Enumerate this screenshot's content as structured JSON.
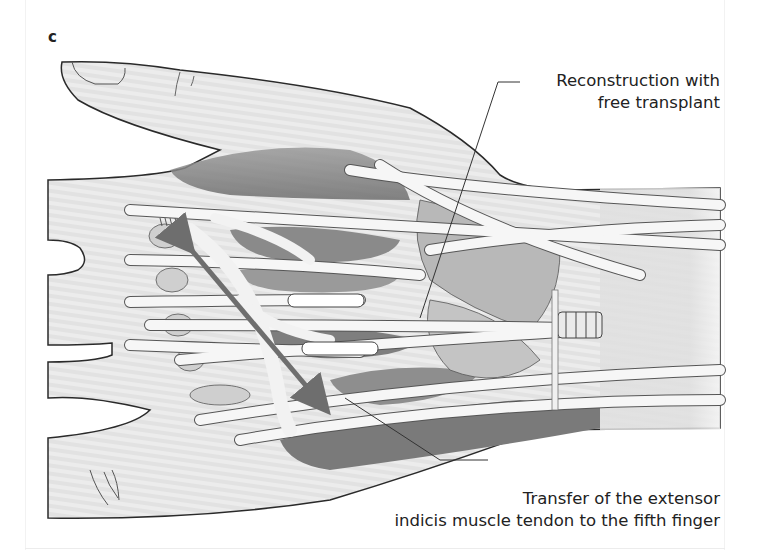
{
  "figure": {
    "panel_label": "c",
    "annotations": [
      {
        "id": "reconstruction",
        "lines": [
          "Reconstruction with",
          "free transplant"
        ]
      },
      {
        "id": "transfer",
        "lines": [
          "Transfer of the extensor",
          "indicis muscle tendon to the fifth finger"
        ]
      }
    ],
    "colors": {
      "skin": "#e4e4e4",
      "muscle_dark": "#8a8a8a",
      "tendon": "#f6f6f6",
      "outline": "#2a2a2a",
      "arrow": "#6e6e6e",
      "text": "#222222"
    }
  }
}
